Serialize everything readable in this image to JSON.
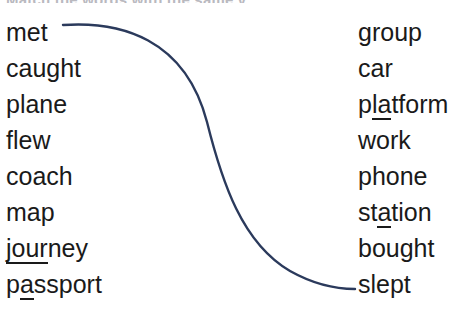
{
  "instruction": {
    "text": "Match the words with the same v"
  },
  "colors": {
    "background": "#ffffff",
    "text": "#1a1a1a",
    "connector": "#2b3a5c",
    "instruction_faded": "#b9b9bf"
  },
  "left_column": [
    {
      "prefix": "met",
      "stressed": "",
      "suffix": ""
    },
    {
      "prefix": "caught",
      "stressed": "",
      "suffix": ""
    },
    {
      "prefix": "plane",
      "stressed": "",
      "suffix": ""
    },
    {
      "prefix": "flew",
      "stressed": "",
      "suffix": ""
    },
    {
      "prefix": "coach",
      "stressed": "",
      "suffix": ""
    },
    {
      "prefix": "map",
      "stressed": "",
      "suffix": ""
    },
    {
      "prefix": "",
      "stressed": "jour",
      "suffix": "ney"
    },
    {
      "prefix": "p",
      "stressed": "a",
      "suffix": "ssport"
    }
  ],
  "right_column": [
    {
      "prefix": "group",
      "stressed": "",
      "suffix": ""
    },
    {
      "prefix": "car",
      "stressed": "",
      "suffix": ""
    },
    {
      "prefix": "p",
      "stressed": "la",
      "suffix": "tform"
    },
    {
      "prefix": "work",
      "stressed": "",
      "suffix": ""
    },
    {
      "prefix": "phone",
      "stressed": "",
      "suffix": ""
    },
    {
      "prefix": "st",
      "stressed": "a",
      "suffix": "tion"
    },
    {
      "prefix": "bought",
      "stressed": "",
      "suffix": ""
    },
    {
      "prefix": "slept",
      "stressed": "",
      "suffix": ""
    }
  ],
  "connector": {
    "from_word": "met",
    "to_word": "slept",
    "path": "M 63 25 C 120 21, 185 38, 207 122 C 222 182, 242 243, 290 271 C 315 285, 338 289, 355 289"
  }
}
